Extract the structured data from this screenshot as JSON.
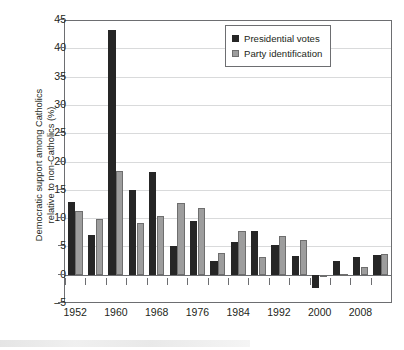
{
  "chart_data": {
    "type": "bar",
    "title": "",
    "xlabel": "",
    "ylabel": "Democratic support among Catholics relative to non-Catholics (%)",
    "ylabel_line1": "Democratic support among Catholics",
    "ylabel_line2": "relative to non-Catholics (%)",
    "ylim": [
      -5,
      45
    ],
    "ytick_step": 5,
    "ytick_labels": [
      "45",
      "40",
      "35",
      "30",
      "25",
      "20",
      "15",
      "10",
      "5",
      "0",
      "–5"
    ],
    "ytick_values": [
      45,
      40,
      35,
      30,
      25,
      20,
      15,
      10,
      5,
      0,
      -5
    ],
    "grid": true,
    "grid_axis": "y",
    "legend_position": "top-right",
    "categories": [
      1952,
      1956,
      1960,
      1964,
      1968,
      1972,
      1976,
      1980,
      1984,
      1988,
      1992,
      1996,
      2000,
      2004,
      2008,
      2012
    ],
    "xtick_labels": [
      "1952",
      "1960",
      "1968",
      "1976",
      "1984",
      "1992",
      "2000",
      "2008"
    ],
    "xtick_values": [
      1952,
      1960,
      1968,
      1976,
      1984,
      1992,
      2000,
      2008
    ],
    "series": [
      {
        "name": "Presidential votes",
        "color": "#262626",
        "values": [
          12.9,
          7.0,
          43.3,
          14.9,
          18.1,
          5.1,
          9.4,
          2.5,
          5.7,
          7.7,
          5.2,
          3.3,
          -2.3,
          2.4,
          3.1,
          3.4
        ]
      },
      {
        "name": "Party identification",
        "color": "#9d9d9d",
        "values": [
          11.2,
          9.8,
          18.3,
          9.2,
          10.3,
          12.7,
          11.8,
          3.8,
          7.7,
          3.1,
          6.9,
          6.2,
          -0.3,
          0.2,
          1.3,
          3.6
        ]
      }
    ]
  },
  "legend": {
    "items": [
      {
        "label": "Presidential votes",
        "swatch": "dark"
      },
      {
        "label": "Party identification",
        "swatch": "gray"
      }
    ]
  },
  "colors": {
    "presidential_votes": "#262626",
    "party_identification": "#9d9d9d",
    "axis": "#6d6e71",
    "grid": "#d9dadb",
    "text": "#231f20",
    "background": "#ffffff"
  }
}
